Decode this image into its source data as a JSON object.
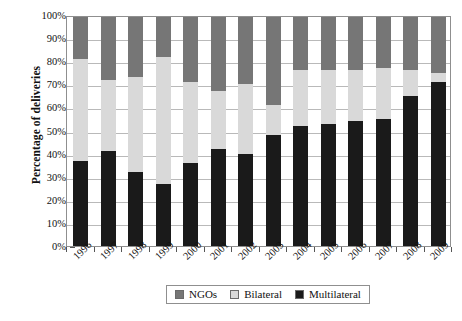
{
  "chart_data": {
    "type": "bar",
    "title": "",
    "subtitle": "",
    "stacked": true,
    "xlabel": "",
    "ylabel": "Percentage of deliveries",
    "ylim": [
      0,
      100
    ],
    "ytick_labels": [
      "0%",
      "10%",
      "20%",
      "30%",
      "40%",
      "50%",
      "60%",
      "70%",
      "80%",
      "90%",
      "100%"
    ],
    "ytick_values": [
      0,
      10,
      20,
      30,
      40,
      50,
      60,
      70,
      80,
      90,
      100
    ],
    "grid": true,
    "legend_position": "bottom",
    "categories": [
      "1996",
      "1997",
      "1998",
      "1999",
      "2000",
      "2001",
      "2002",
      "2003",
      "2004",
      "2005",
      "2006",
      "2007",
      "2008",
      "2009"
    ],
    "series": [
      {
        "name": "Multilateral",
        "color": "#1a1a1a",
        "values": [
          37,
          41,
          32,
          27,
          36,
          42,
          40,
          48,
          52,
          53,
          54,
          55,
          65,
          71
        ]
      },
      {
        "name": "Bilateral",
        "color": "#d9d9d9",
        "values": [
          44,
          31,
          41,
          55,
          35,
          25,
          30,
          13,
          24,
          23,
          22,
          22,
          11,
          4
        ]
      },
      {
        "name": "NGOs",
        "color": "#767676",
        "values": [
          19,
          28,
          27,
          18,
          29,
          33,
          30,
          39,
          24,
          24,
          24,
          23,
          24,
          25
        ]
      }
    ],
    "cumulative_tops": {
      "multilateral": [
        37,
        41,
        32,
        27,
        36,
        42,
        40,
        48,
        52,
        53,
        54,
        55,
        65,
        71
      ],
      "bilateral": [
        81,
        72,
        73,
        82,
        71,
        67,
        70,
        61,
        76,
        76,
        76,
        77,
        76,
        75
      ],
      "ngos": [
        100,
        100,
        100,
        100,
        100,
        100,
        100,
        100,
        100,
        100,
        100,
        100,
        100,
        100
      ]
    }
  },
  "legend": {
    "items": [
      {
        "label": "NGOs",
        "color": "#767676"
      },
      {
        "label": "Bilateral",
        "color": "#d9d9d9"
      },
      {
        "label": "Multilateral",
        "color": "#1a1a1a"
      }
    ]
  }
}
